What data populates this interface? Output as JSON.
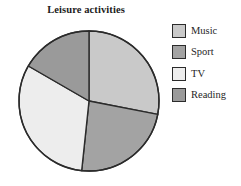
{
  "chart_data": {
    "type": "pie",
    "title": "Leisure activities",
    "xlabel": "",
    "ylabel": "",
    "legend_position": "right",
    "grid": false,
    "categories": [
      "Music",
      "Sport",
      "TV",
      "Reading"
    ],
    "values": [
      28,
      24,
      32,
      16
    ],
    "units": "percent",
    "start_angle_deg": 0,
    "direction": "clockwise",
    "slices": [
      {
        "label": "Music",
        "value": 28,
        "color": "#c9c9c9",
        "start_angle_deg": 0,
        "end_angle_deg": 101
      },
      {
        "label": "Sport",
        "value": 24,
        "color": "#a3a3a3",
        "start_angle_deg": 101,
        "end_angle_deg": 186
      },
      {
        "label": "TV",
        "value": 32,
        "color": "#ededed",
        "start_angle_deg": 186,
        "end_angle_deg": 300
      },
      {
        "label": "Reading",
        "value": 16,
        "color": "#9a9a9a",
        "start_angle_deg": 300,
        "end_angle_deg": 360
      }
    ]
  },
  "legend": {
    "entries": [
      {
        "label": "Music",
        "color": "#c9c9c9"
      },
      {
        "label": "Sport",
        "color": "#a3a3a3"
      },
      {
        "label": "TV",
        "color": "#ededed"
      },
      {
        "label": "Reading",
        "color": "#9a9a9a"
      }
    ]
  },
  "style": {
    "outline_color": "#2b2b2b",
    "background": "#ffffff",
    "text_color": "#1f1f1f"
  },
  "geometry": {
    "center_x": 89,
    "center_y": 101,
    "radius": 70
  }
}
